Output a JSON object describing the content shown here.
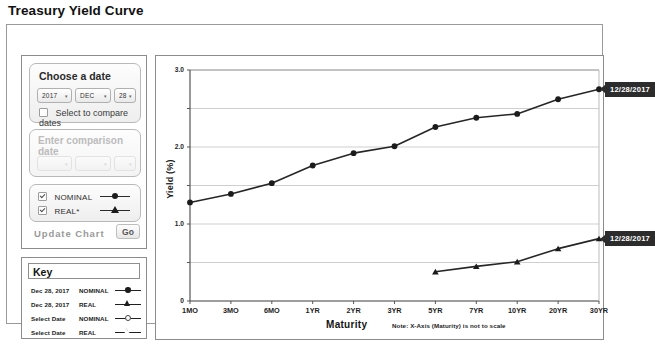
{
  "page_title": "Treasury Yield Curve",
  "controls": {
    "date_panel": {
      "label": "Choose a date",
      "year": "2017",
      "month": "DEC",
      "day": "28",
      "caret": "▾",
      "compare_checkbox_label": "Select to compare dates",
      "compare_checked": false
    },
    "comparison_panel": {
      "label": "Enter comparison date",
      "year": "",
      "month": "",
      "day": "",
      "caret": "▾",
      "disabled": true
    },
    "series_panel": {
      "nominal_label": "NOMINAL",
      "nominal_checked": true,
      "real_label": "REAL*",
      "real_checked": true
    },
    "update_label": "Update Chart",
    "go_label": "Go"
  },
  "key": {
    "title": "Key",
    "rows": [
      {
        "date": "Dec 28, 2017",
        "type": "NOMINAL",
        "marker": "filled-circle"
      },
      {
        "date": "Dec 28, 2017",
        "type": "REAL",
        "marker": "filled-triangle"
      },
      {
        "date": "Select Date",
        "type": "NOMINAL",
        "marker": "open-circle"
      },
      {
        "date": "Select Date",
        "type": "REAL",
        "marker": "open-triangle"
      }
    ]
  },
  "tooltips": {
    "nominal": "12/28/2017",
    "real": "12/28/2017"
  },
  "chart_data": {
    "type": "line",
    "title": "",
    "xlabel": "Maturity",
    "ylabel": "Yield (%)",
    "xnote": "Note: X-Axis (Maturity) is not to scale",
    "categories": [
      "1MO",
      "3MO",
      "6MO",
      "1YR",
      "2YR",
      "3YR",
      "5YR",
      "7YR",
      "10YR",
      "20YR",
      "30YR"
    ],
    "ylim": [
      0,
      3.0
    ],
    "yticks": [
      "0",
      "1.0",
      "2.0",
      "3.0"
    ],
    "ytick_values": [
      0,
      1.0,
      2.0,
      3.0
    ],
    "gridlines": [
      0,
      0.5,
      1.0,
      1.5,
      2.0,
      2.5,
      3.0
    ],
    "grid": true,
    "legend_position": "external-key-box",
    "series": [
      {
        "name": "NOMINAL",
        "marker": "circle",
        "values": [
          1.28,
          1.39,
          1.53,
          1.76,
          1.92,
          2.01,
          2.26,
          2.38,
          2.43,
          2.62,
          2.75
        ]
      },
      {
        "name": "REAL",
        "marker": "triangle",
        "values": [
          null,
          null,
          null,
          null,
          null,
          null,
          0.38,
          0.45,
          0.51,
          0.68,
          0.81
        ]
      }
    ]
  }
}
